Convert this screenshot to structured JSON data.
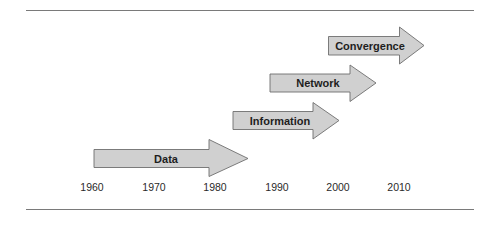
{
  "diagram": {
    "type": "timeline-arrows",
    "colors": {
      "arrow_fill": "#d0d0d0",
      "arrow_stroke": "#6e6e6e",
      "text": "#1e1e1e",
      "rule": "#7a7a7a"
    },
    "arrows": [
      {
        "label": "Data",
        "start_year": 1960,
        "end_year": 1985
      },
      {
        "label": "Information",
        "start_year": 1983,
        "end_year": 2001
      },
      {
        "label": "Network",
        "start_year": 1989,
        "end_year": 2007
      },
      {
        "label": "Convergence",
        "start_year": 1999,
        "end_year": 2014
      }
    ],
    "axis": {
      "years": [
        "1960",
        "1970",
        "1980",
        "1990",
        "2000",
        "2010"
      ]
    }
  }
}
